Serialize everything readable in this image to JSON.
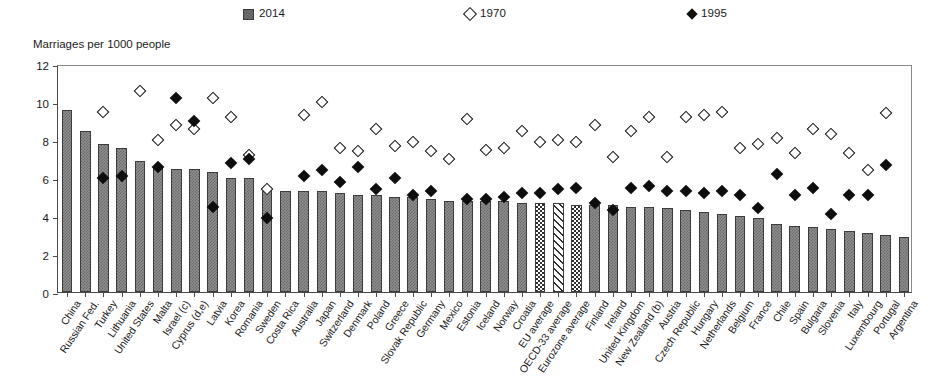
{
  "axis_title": "Marriages per 1000 people",
  "legend": [
    {
      "label": "2014",
      "marker": "filled-square",
      "color": "#6f6f6f"
    },
    {
      "label": "1970",
      "marker": "open-diamond",
      "color": "#ffffff"
    },
    {
      "label": "1995",
      "marker": "filled-diamond",
      "color": "#111111"
    }
  ],
  "chart_data": {
    "type": "bar",
    "title": "",
    "subtitle": "",
    "xlabel": "",
    "ylabel": "Marriages per 1000 people",
    "ylim": [
      0,
      12
    ],
    "yticks": [
      0,
      2,
      4,
      6,
      8,
      10,
      12
    ],
    "grid": false,
    "legend_position": "top",
    "categories": [
      "China",
      "Russian Fed.",
      "Turkey",
      "Lithuania",
      "United States",
      "Malta",
      "Israel (c)",
      "Cyprus (d,e)",
      "Latvia",
      "Korea",
      "Romania",
      "Sweden",
      "Costa Rica",
      "Australia",
      "Japan",
      "Switzerland",
      "Denmark",
      "Poland",
      "Greece",
      "Slovak Republic",
      "Germany",
      "Mexico",
      "Estonia",
      "Iceland",
      "Norway",
      "Croatia",
      "EU average",
      "OECD-33 average",
      "Eurozone average",
      "Finland",
      "Ireland",
      "United Kingdom",
      "New Zealand (b)",
      "Austria",
      "Czech Republic",
      "Hungary",
      "Netherlands",
      "Belgium",
      "France",
      "Chile",
      "Spain",
      "Bulgaria",
      "Slovenia",
      "Italy",
      "Luxembourg",
      "Portugal",
      "Argentina"
    ],
    "series": [
      {
        "name": "2014",
        "marker": "bar",
        "values": [
          9.6,
          8.5,
          7.8,
          7.6,
          6.9,
          6.6,
          6.5,
          6.5,
          6.3,
          6.0,
          6.0,
          5.4,
          5.3,
          5.3,
          5.3,
          5.2,
          5.1,
          5.1,
          5.0,
          5.0,
          4.9,
          4.8,
          4.8,
          4.8,
          4.8,
          4.7,
          4.7,
          4.7,
          4.6,
          4.6,
          4.6,
          4.5,
          4.5,
          4.4,
          4.3,
          4.2,
          4.1,
          4.0,
          3.9,
          3.6,
          3.5,
          3.4,
          3.3,
          3.2,
          3.1,
          3.0,
          2.9
        ]
      },
      {
        "name": "1970",
        "marker": "open-diamond",
        "values": [
          null,
          null,
          9.5,
          null,
          10.6,
          8.0,
          8.8,
          8.6,
          10.2,
          9.2,
          7.2,
          5.4,
          null,
          9.3,
          10.0,
          7.6,
          7.4,
          8.6,
          7.7,
          7.9,
          7.4,
          7.0,
          9.1,
          7.5,
          7.6,
          8.5,
          7.9,
          8.0,
          7.9,
          8.8,
          7.1,
          8.5,
          9.2,
          7.1,
          9.2,
          9.3,
          9.5,
          7.6,
          7.8,
          8.1,
          7.3,
          8.6,
          8.3,
          7.3,
          6.4,
          9.4,
          null
        ]
      },
      {
        "name": "1995",
        "marker": "filled-diamond",
        "values": [
          null,
          null,
          6.0,
          6.1,
          null,
          6.6,
          10.2,
          9.0,
          4.5,
          6.8,
          7.0,
          3.9,
          null,
          6.1,
          6.4,
          5.8,
          6.6,
          5.4,
          6.0,
          5.1,
          5.3,
          null,
          4.9,
          4.9,
          5.0,
          5.2,
          5.2,
          5.4,
          5.5,
          4.7,
          4.3,
          5.5,
          5.6,
          5.3,
          5.3,
          5.2,
          5.3,
          5.1,
          4.4,
          6.2,
          5.1,
          5.5,
          4.1,
          5.1,
          5.1,
          6.7,
          null
        ]
      }
    ]
  }
}
